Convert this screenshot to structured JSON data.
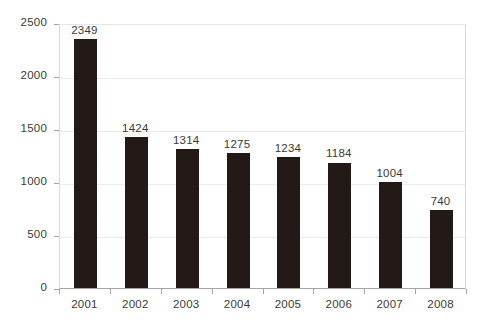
{
  "chart_data": {
    "type": "bar",
    "title": "",
    "subtitle": "",
    "xlabel": "",
    "ylabel": "",
    "categories": [
      "2001",
      "2002",
      "2003",
      "2004",
      "2005",
      "2006",
      "2007",
      "2008"
    ],
    "values": [
      2349,
      1424,
      1314,
      1275,
      1234,
      1184,
      1004,
      740
    ],
    "data_labels": [
      "2349",
      "1424",
      "1314",
      "1275",
      "1234",
      "1184",
      "1004",
      "740"
    ],
    "ylim": [
      0,
      2500
    ],
    "y_ticks": [
      0,
      500,
      1000,
      1500,
      2000,
      2500
    ],
    "y_tick_labels": [
      "0",
      "500",
      "1000",
      "1500",
      "2000",
      "2500"
    ],
    "grid": true,
    "grid_axis": "y",
    "legend": false,
    "legend_entries": [],
    "annotations": [],
    "colors": {
      "bar": "#231a17",
      "gridline": "#ececec",
      "axis": "#a6a6a6",
      "plot_border": "#d9d9d9",
      "text": "#3a3a3a",
      "background": "#ffffff"
    }
  }
}
